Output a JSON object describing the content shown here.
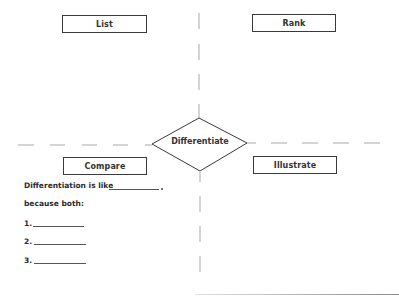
{
  "diagram": {
    "center": {
      "label": "Differentiate"
    },
    "quadrants": [
      {
        "id": "list",
        "label": "List"
      },
      {
        "id": "rank",
        "label": "Rank"
      },
      {
        "id": "compare",
        "label": "Compare"
      },
      {
        "id": "illustrate",
        "label": "Illustrate"
      }
    ],
    "colors": {
      "line": "#3a3a3a",
      "dashes": "#b5b5b5",
      "text": "#2a2a2a"
    }
  },
  "compare_prompt": {
    "sentence": "Differentiation is like",
    "sentence_end": ".",
    "because": "because both:",
    "items": [
      {
        "number": "1."
      },
      {
        "number": "2."
      },
      {
        "number": "3."
      }
    ]
  }
}
